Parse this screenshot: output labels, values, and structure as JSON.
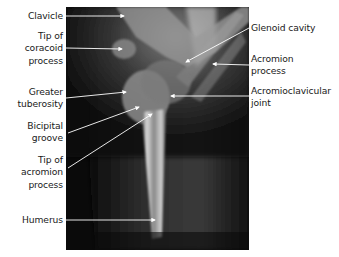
{
  "figure": {
    "labels_left": [
      {
        "id": "clavicle",
        "lines": [
          "Clavicle"
        ]
      },
      {
        "id": "coracoid",
        "lines": [
          "Tip of",
          "coracoid",
          "process"
        ]
      },
      {
        "id": "greater-tuberosity",
        "lines": [
          "Greater",
          "tuberosity"
        ]
      },
      {
        "id": "bicipital-groove",
        "lines": [
          "Bicipital",
          "groove"
        ]
      },
      {
        "id": "acromion-tip",
        "lines": [
          "Tip of",
          "acromion",
          "process"
        ]
      },
      {
        "id": "humerus",
        "lines": [
          "Humerus"
        ]
      }
    ],
    "labels_right": [
      {
        "id": "glenoid",
        "lines": [
          "Glenoid cavity"
        ]
      },
      {
        "id": "acromion-process",
        "lines": [
          "Acromion",
          "process"
        ]
      },
      {
        "id": "ac-joint",
        "lines": [
          "Acromioclavicular",
          "joint"
        ]
      }
    ],
    "colors": {
      "background": "#ffffff",
      "xray_base": "#0a0a0a",
      "leader_line": "#ffffff",
      "label_text": "#1a1a1a"
    }
  }
}
